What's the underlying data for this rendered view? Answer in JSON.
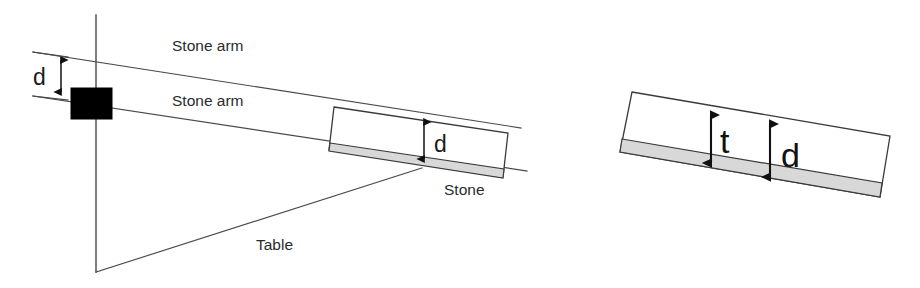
{
  "figure": {
    "background_color": "#ffffff",
    "line_color": "#3a3a3a",
    "stone_strip_color": "#d8d8d8",
    "pivot_color": "#000000",
    "width": 920,
    "height": 288
  },
  "left_figure": {
    "labels": {
      "stone_arm_upper": "Stone arm",
      "stone_arm_lower": "Stone arm",
      "stone": "Stone",
      "table": "Table",
      "gap_dimension": "d",
      "stone_dimension": "d"
    }
  },
  "right_figure": {
    "labels": {
      "thickness_dimension": "t",
      "offset_dimension": "d"
    }
  },
  "dimensions": [
    {
      "symbol": "d",
      "location": "left-arm-gap",
      "description": "vertical gap between the two stone arm lines at the pivot"
    },
    {
      "symbol": "d",
      "location": "left-stone",
      "description": "vertical distance from upper arm line to the stone underside"
    },
    {
      "symbol": "t",
      "location": "right-stone",
      "description": "thickness from the stone top face to the top of the shaded strip"
    },
    {
      "symbol": "d",
      "location": "right-stone",
      "description": "distance from the stone top face to the bottom of the shaded strip"
    }
  ]
}
